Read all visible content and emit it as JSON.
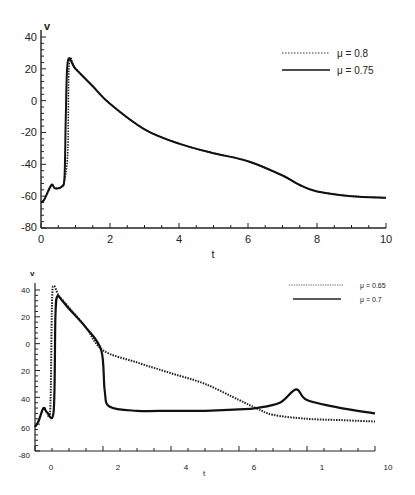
{
  "chart_data": [
    {
      "type": "line",
      "title": "",
      "xlabel": "t",
      "ylabel": "v",
      "xlim": [
        0,
        10
      ],
      "ylim": [
        -80,
        40
      ],
      "xticks": [
        "0",
        "2",
        "4",
        "6",
        "8",
        "10"
      ],
      "yticks": [
        "40",
        "20",
        "0",
        "-20",
        "-40",
        "-60",
        "-80"
      ],
      "grid": false,
      "legend_position": "upper right",
      "series": [
        {
          "name": "μ = 0.8",
          "style": "dotted",
          "x": [
            0,
            0.1,
            0.3,
            0.4,
            0.6,
            0.7,
            0.78,
            0.82,
            1.0,
            1.5,
            2,
            3,
            4,
            5,
            6,
            7,
            7.5,
            8,
            9,
            10
          ],
          "y": [
            -64,
            -62,
            -53,
            -55,
            -54,
            -48,
            -30,
            24,
            20,
            9,
            -2,
            -18,
            -27,
            -33,
            -38,
            -47,
            -53,
            -57,
            -60,
            -61
          ]
        },
        {
          "name": "μ = 0.75",
          "style": "solid",
          "x": [
            0,
            0.1,
            0.3,
            0.4,
            0.6,
            0.68,
            0.72,
            0.78,
            1.0,
            1.5,
            2,
            3,
            4,
            5,
            6,
            7,
            7.5,
            8,
            9,
            10
          ],
          "y": [
            -64,
            -62,
            -53,
            -55,
            -54,
            -48,
            -10,
            25,
            20,
            9,
            -2,
            -18,
            -27,
            -33,
            -38,
            -47,
            -53,
            -57,
            -60,
            -61
          ]
        }
      ]
    },
    {
      "type": "line",
      "title": "",
      "xlabel": "t",
      "ylabel": "v",
      "xlim": [
        0,
        10
      ],
      "ylim": [
        -80,
        40
      ],
      "xticks": [
        "0",
        "2",
        "4",
        "6",
        "8",
        "10"
      ],
      "yticks": [
        "40",
        "20",
        "0",
        "-20",
        "-40",
        "-60",
        "-80"
      ],
      "grid": false,
      "legend_position": "upper right",
      "series": [
        {
          "name": "μ = 0.65",
          "style": "dotted",
          "x": [
            0,
            0.1,
            0.25,
            0.35,
            0.45,
            0.5,
            0.55,
            0.7,
            1.0,
            1.5,
            2,
            3,
            4,
            5,
            6,
            6.5,
            7,
            8,
            9,
            10
          ],
          "y": [
            -62,
            -58,
            -48,
            -51,
            -48,
            30,
            43,
            36,
            27,
            12,
            -5,
            -14,
            -22,
            -30,
            -42,
            -48,
            -53,
            -56,
            -57,
            -58
          ]
        },
        {
          "name": "μ = 0.7",
          "style": "solid",
          "x": [
            0,
            0.1,
            0.25,
            0.35,
            0.55,
            0.6,
            0.65,
            0.8,
            1.0,
            1.5,
            1.95,
            2.05,
            2.2,
            3,
            4,
            5,
            6,
            6.5,
            7.2,
            7.68,
            8,
            9,
            10
          ],
          "y": [
            -62,
            -58,
            -48,
            -51,
            -50,
            20,
            35,
            32,
            26,
            12,
            -5,
            -35,
            -47,
            -50,
            -50,
            -50,
            -49,
            -48,
            -44,
            -34,
            -42,
            -48,
            -52
          ]
        }
      ]
    }
  ],
  "charts": {
    "top": {
      "ylabel": "v",
      "xlabel": "t",
      "yticks": [
        "40",
        "20",
        "0",
        "-20",
        "-40",
        "-60",
        "-80"
      ],
      "xticks": [
        "0",
        "2",
        "4",
        "6",
        "8",
        "10"
      ],
      "legend": [
        "μ = 0.8",
        "μ = 0.75"
      ]
    },
    "bottom": {
      "ylabel": "v",
      "xlabel": "t",
      "yticks": [
        "40",
        "20",
        "0",
        "20",
        "40",
        "60",
        "-80"
      ],
      "xticks": [
        "0",
        "2",
        "4",
        "6",
        "1",
        "10"
      ],
      "legend": [
        "μ = 0.65",
        "μ = 0.7"
      ]
    }
  }
}
